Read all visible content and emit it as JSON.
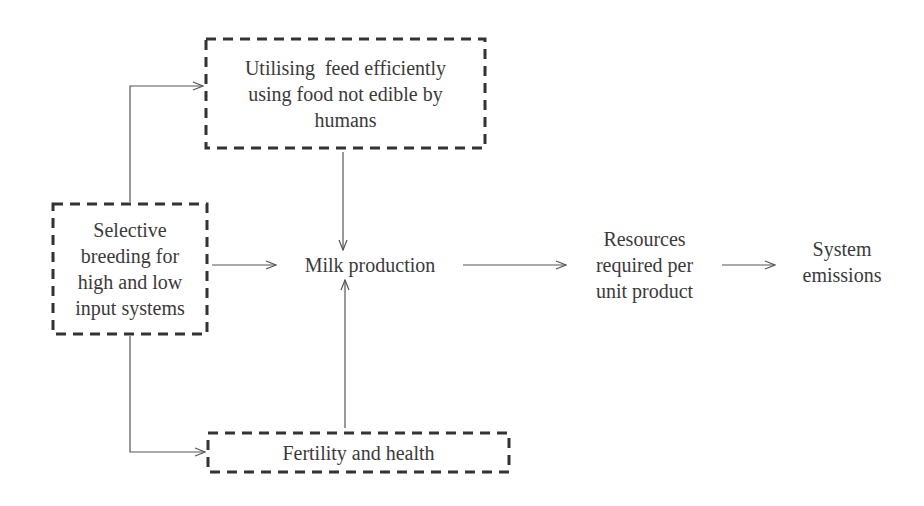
{
  "diagram": {
    "type": "flowchart",
    "nodes": {
      "breeding": {
        "label": "Selective breeding for high and low input systems",
        "lines": [
          "Selective",
          "breeding for",
          "high and low",
          "input systems"
        ],
        "style": "dashed-box"
      },
      "feed": {
        "label": "Utilising  feed efficiently using food not edible by humans",
        "lines": [
          "Utilising  feed efficiently",
          "using food not edible by",
          "humans"
        ],
        "style": "dashed-box"
      },
      "fertility": {
        "label": "Fertility and health",
        "lines": [
          "Fertility and health"
        ],
        "style": "dashed-box"
      },
      "milk": {
        "label": "Milk production",
        "lines": [
          "Milk production"
        ],
        "style": "plain"
      },
      "resources": {
        "label": "Resources required per unit product",
        "lines": [
          "Resources",
          "required per",
          "unit product"
        ],
        "style": "plain"
      },
      "emissions": {
        "label": "System emissions",
        "lines": [
          "System",
          "emissions"
        ],
        "style": "plain"
      }
    },
    "edges": [
      {
        "from": "breeding",
        "to": "feed"
      },
      {
        "from": "breeding",
        "to": "fertility"
      },
      {
        "from": "breeding",
        "to": "milk"
      },
      {
        "from": "feed",
        "to": "milk"
      },
      {
        "from": "fertility",
        "to": "milk"
      },
      {
        "from": "milk",
        "to": "resources"
      },
      {
        "from": "resources",
        "to": "emissions"
      }
    ],
    "colors": {
      "text": "#3a3a3a",
      "box_border": "#333333",
      "arrow": "#555555",
      "background": "#ffffff"
    }
  }
}
